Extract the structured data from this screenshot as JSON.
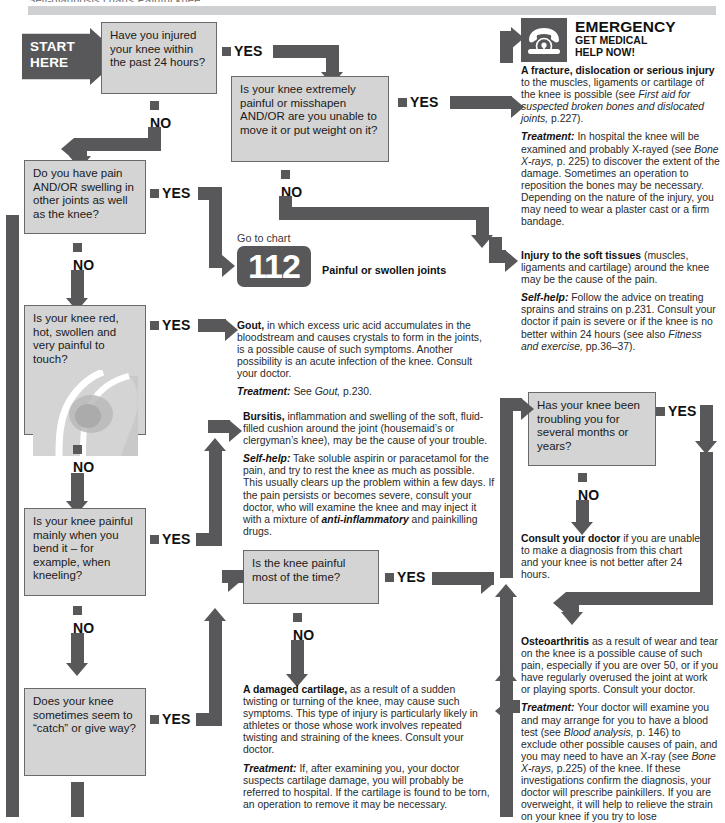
{
  "page": {
    "running_head_cut": "Self-diagnosis charts  Painful knee",
    "left_spine_color": "#58585a",
    "box_fill": "#d4d4d4",
    "ink": "#58585a"
  },
  "labels": {
    "yes": "YES",
    "no": "NO",
    "start": "START\nHERE"
  },
  "questions": [
    {
      "id": "q1",
      "text": "Have you injured your knee within the past 24 hours?"
    },
    {
      "id": "q2",
      "text": "Is your knee extremely painful or misshapen AND/OR are you unable to move it or put weight on it?"
    },
    {
      "id": "q3",
      "text": "Do you have pain AND/OR swelling in other joints as well as the knee?"
    },
    {
      "id": "q4",
      "text": "Is your knee red, hot, swollen and very painful to touch?"
    },
    {
      "id": "q5",
      "text": "Is your knee painful mainly when you bend it – for example, when kneeling?"
    },
    {
      "id": "q6",
      "text": "Is the knee painful most of the time?"
    },
    {
      "id": "q7",
      "text": "Does your knee sometimes seem to “catch” or give way?"
    },
    {
      "id": "q8",
      "text": "Has your knee been troubling you for several months or years?"
    }
  ],
  "emergency": {
    "icon": "telephone-icon",
    "title": "EMERGENCY",
    "subtitle_line1": "GET MEDICAL",
    "subtitle_line2": "HELP NOW!",
    "diagnosis_bold": "A fracture, dislocation or serious injury",
    "diagnosis_rest": " to the muscles, ligaments or cartilage of the knee is possible (see ",
    "diagnosis_italic": "First aid for suspected broken bones and dislocated joints,",
    "diagnosis_tail": " p.227).",
    "treatment_label": "Treatment:",
    "treatment_part1": " In hospital the knee will be examined and probably X-rayed (see ",
    "treatment_italic": "Bone X-rays,",
    "treatment_part2": " p. 225) to discover the extent of the damage. Sometimes an operation to reposition the bones may be necessary. Depending on the nature of the injury, you may need to wear a plaster cast or a firm bandage."
  },
  "goto_chart": {
    "prefix": "Go to chart",
    "number": "112",
    "title": "Painful or swollen joints"
  },
  "soft_tissue": {
    "bold": "Injury to the soft tissues",
    "rest": " (muscles, ligaments and cartilage) around the knee may be the cause of the pain.",
    "selfhelp_label": "Self-help:",
    "selfhelp_part1": " Follow the advice on treating sprains and strains on p.231. Consult your doctor if pain is severe or if the knee is no better within 24 hours (see also ",
    "selfhelp_italic": "Fitness and exercise,",
    "selfhelp_part2": " pp.36–37)."
  },
  "gout": {
    "bold": "Gout,",
    "rest": " in which excess uric acid accumulates in the bloodstream and causes crystals to form in the joints, is a possible cause of such symptoms. Another possibility is an acute infection of the knee. Consult your doctor.",
    "treatment_label": "Treatment:",
    "treatment_part1": " See ",
    "treatment_italic": "Gout,",
    "treatment_part2": " p.230."
  },
  "bursitis": {
    "bold": "Bursitis,",
    "rest": " inflammation and swelling of the soft, fluid-filled cushion around the joint (housemaid’s or clergyman’s knee), may be the cause of your trouble.",
    "selfhelp_label": "Self-help:",
    "selfhelp_part1": " Take soluble aspirin or paracetamol for the pain, and try to rest the knee as much as possible. This usually clears up the problem within a few days. If the pain persists or becomes severe, consult your doctor, who will examine the knee and may inject it with a mixture of ",
    "selfhelp_italic": "anti-inflammatory",
    "selfhelp_part2": " and painkilling drugs."
  },
  "consult": {
    "bold": "Consult your doctor",
    "rest": " if you are unable to make a diagnosis from this chart and your knee is not better after 24 hours."
  },
  "cartilage": {
    "bold": "A damaged cartilage,",
    "rest": " as a result of a sudden twisting or turning of the knee, may cause such symptoms. This type of injury is particularly likely in athletes or those whose work involves repeated twisting and straining of the knees. Consult your doctor.",
    "treatment_label": "Treatment:",
    "treatment_rest": " If, after examining you, your doctor suspects cartilage damage, you will probably be referred to hospital. If the cartilage is found to be torn, an operation to remove it may be necessary."
  },
  "osteoarthritis": {
    "bold": "Osteoarthritis",
    "rest": " as a result of wear and tear on the knee is a possible cause of such pain, especially if you are over 50, or if you have regularly overused the joint at work or playing sports. Consult your doctor.",
    "treatment_label": "Treatment:",
    "treatment_part1": " Your doctor will examine you and may arrange for you to have a blood test (see ",
    "treatment_italic1": "Blood analysis,",
    "treatment_part2": " p. 146) to exclude other possible causes of pain, and you may need to have an X-ray (see ",
    "treatment_italic2": "Bone X-rays,",
    "treatment_part3": " p.225) of the knee. If these investigations confirm the diagnosis, your doctor will prescribe painkillers. If you are overweight, it will help to relieve the strain on your knee if you try to lose"
  }
}
